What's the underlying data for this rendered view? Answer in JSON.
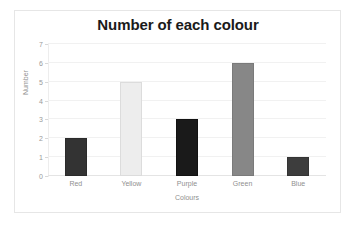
{
  "chart_data": {
    "type": "bar",
    "title": "Number of each colour",
    "xlabel": "Colours",
    "ylabel": "Number",
    "categories": [
      "Red",
      "Yellow",
      "Purple",
      "Green",
      "Blue"
    ],
    "values": [
      2,
      5,
      3,
      6,
      1
    ],
    "bar_colors": [
      "#333333",
      "#ededed",
      "#1a1a1a",
      "#878787",
      "#3d3d3d"
    ],
    "bar_border_colors": [
      "#2b2b2b",
      "#dcdcdc",
      "#121212",
      "#7a7a7a",
      "#343434"
    ],
    "ylim": [
      0,
      7
    ],
    "yticks": [
      0,
      1,
      2,
      3,
      4,
      5,
      6,
      7
    ],
    "ytick_labels": [
      "0",
      "1",
      "2",
      "3",
      "4",
      "5",
      "6",
      "7"
    ],
    "grid": true,
    "grid_color": "#f1f1f1",
    "legend": false,
    "legend_position": "none",
    "frame_color": "#e6e6e6",
    "background": "#ffffff",
    "title_color": "#1a1a1a",
    "tick_label_color": "#9a9a9a"
  }
}
